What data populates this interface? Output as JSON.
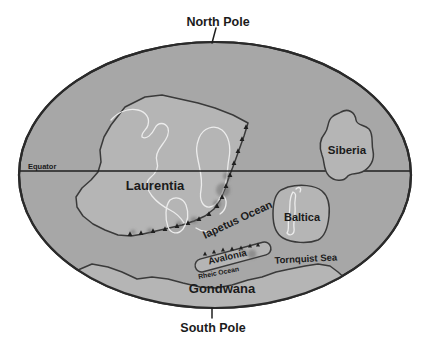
{
  "diagram": {
    "type": "paleogeographic-world-map",
    "poles": {
      "north": "North Pole",
      "south": "South Pole"
    },
    "equator_label": "Equator",
    "continents": {
      "laurentia": "Laurentia",
      "siberia": "Siberia",
      "baltica": "Baltica",
      "avalonia": "Avalonia",
      "gondwana": "Gondwana"
    },
    "oceans": {
      "iapetus": "Iapetus Ocean",
      "rheic": "Rheic Ocean",
      "tornquist": "Tornquist Sea"
    },
    "icons": {
      "volcanic_arc": "small black triangles along convergent margins"
    },
    "colors": {
      "background": "#ffffff",
      "ocean": "#a7a7a7",
      "land": "#b5b5b5",
      "outline": "#2a2a2a",
      "coastline": "#ececec",
      "label": "#1b1b1b",
      "volcanic_arc": "#1f1f1f"
    }
  }
}
